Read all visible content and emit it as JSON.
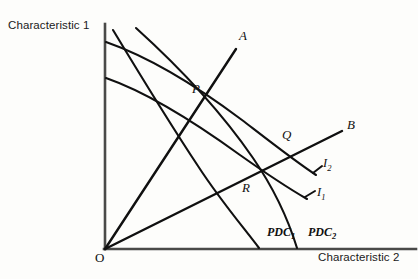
{
  "figure": {
    "type": "economics-characteristics-diagram",
    "background_color": "#fdfdfb",
    "ink_color": "#101010",
    "axes": {
      "y_label": "Characteristic 1",
      "x_label": "Characteristic 2",
      "origin_label": "O",
      "x_axis": {
        "x1": 105,
        "y1": 249,
        "x2": 415,
        "y2": 249
      },
      "y_axis": {
        "x1": 105,
        "y1": 249,
        "x2": 105,
        "y2": 24
      }
    },
    "rays": [
      {
        "name": "ray-a",
        "label": "A",
        "label_x": 240,
        "label_y": 31,
        "from": [
          105,
          249
        ],
        "to": [
          236,
          49
        ]
      },
      {
        "name": "ray-b",
        "label": "B",
        "label_x": 348,
        "label_y": 122,
        "from": [
          105,
          249
        ],
        "to": [
          342,
          131
        ]
      }
    ],
    "indifference_curves": [
      {
        "name": "indifference-curve-i2",
        "label": "I",
        "subscript": "2",
        "label_x": 324,
        "label_y": 160,
        "path": "M 106,42 C 150,56 200,88 240,118 C 266,138 292,158 316,174"
      },
      {
        "name": "indifference-curve-i1",
        "label": "I",
        "subscript": "1",
        "label_x": 318,
        "label_y": 189,
        "path": "M 106,78 C 150,92 200,124 240,154 C 266,172 288,186 308,198"
      }
    ],
    "pdc_curves": [
      {
        "name": "pdc-curve-1",
        "label": "PDC",
        "subscript": "1",
        "label_x": 268,
        "label_y": 229,
        "path": "M 113,30 C 140,74 168,120 196,162 C 220,198 242,226 258,248"
      },
      {
        "name": "pdc-curve-2",
        "label": "PDC",
        "subscript": "2",
        "label_x": 310,
        "label_y": 229,
        "path": "M 136,28 C 176,64 218,108 252,156 C 274,188 288,222 296,248"
      }
    ],
    "intersection_points": [
      {
        "name": "point-p",
        "label": "P",
        "x": 200,
        "y": 105,
        "label_x": 193,
        "label_y": 86
      },
      {
        "name": "point-q",
        "label": "Q",
        "x": 286,
        "y": 153,
        "label_x": 283,
        "label_y": 132
      },
      {
        "name": "point-r",
        "label": "R",
        "x": 249,
        "y": 181,
        "label_x": 243,
        "label_y": 184
      }
    ]
  }
}
